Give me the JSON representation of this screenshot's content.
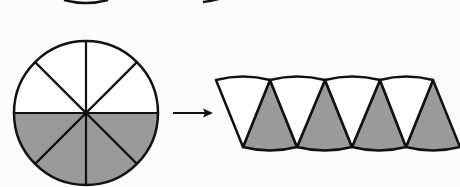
{
  "figure": {
    "colors": {
      "background": "#fbfbfb",
      "stroke": "#111111",
      "shaded": "#9a9a9a",
      "unshaded": "#ffffff"
    },
    "circle": {
      "sectors": 8,
      "shaded_sectors": 4,
      "unshaded_sectors": 4
    },
    "arrow": {
      "direction": "right"
    },
    "rearranged": {
      "pieces": 8,
      "shaded_pieces_pointing_up": 4,
      "unshaded_pieces_pointing_down": 4
    }
  }
}
